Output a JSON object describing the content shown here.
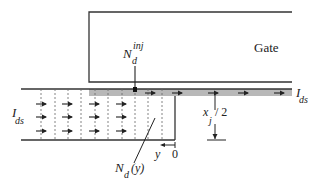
{
  "diagram": {
    "gate_label": "Gate",
    "injection_label": {
      "base": "N",
      "sub": "d",
      "sup": "inj"
    },
    "current_left": {
      "base": "I",
      "sub": "ds"
    },
    "current_right": {
      "base": "I",
      "sub": "ds"
    },
    "junction_depth": {
      "base": "x",
      "sub": "j",
      "suffix": "/ 2"
    },
    "doping_label": {
      "base": "N",
      "sub": "d",
      "suffix": "(y)"
    },
    "y_axis_label": "y",
    "origin_label": "0",
    "colors": {
      "line": "#333333",
      "channel_fill": "#b8b8b8",
      "dotted": "#666666"
    }
  }
}
